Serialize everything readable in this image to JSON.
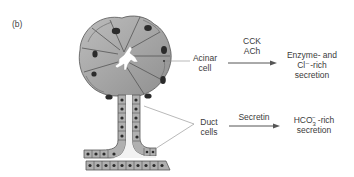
{
  "panel_label": "(b)",
  "labels": {
    "acinar_cell": [
      "Acinar",
      "cell"
    ],
    "duct_cells": [
      "Duct",
      "cells"
    ]
  },
  "pathways": [
    {
      "source": "Acinar cell",
      "stimuli": [
        "CCK",
        "ACh"
      ],
      "product_lines": [
        "Enzyme- and",
        "Cl⁻-rich",
        "secretion"
      ]
    },
    {
      "source": "Duct cells",
      "stimuli": [
        "Secretin"
      ],
      "product_ion": "HCO",
      "product_ion_sub": "3",
      "product_ion_sup": "−",
      "product_lines": [
        "-rich",
        "secretion"
      ]
    }
  ],
  "colors": {
    "cell_fill": "#a8a8a8",
    "cell_stroke": "#555555",
    "nucleus": "#2a2a2a",
    "lumen": "#ffffff",
    "arrow": "#555555",
    "leader_line": "#8a8a8a"
  }
}
